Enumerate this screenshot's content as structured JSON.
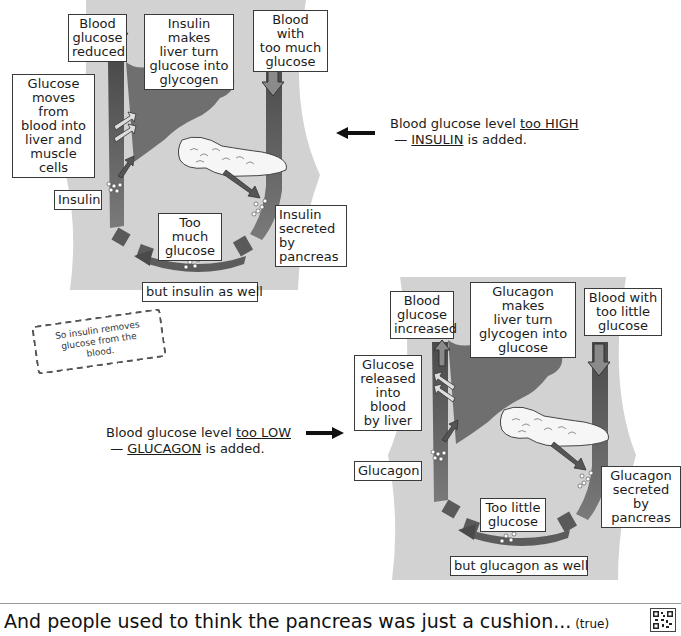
{
  "top_diagram": {
    "boxes": {
      "blood_glucose_reduced": "Blood\nglucose\nreduced",
      "insulin_makes_liver": "Insulin makes\nliver turn\nglucose into\nglycogen",
      "blood_too_much": "Blood with\ntoo much\nglucose",
      "glucose_moves": "Glucose\nmoves from\nblood into\nliver and\nmuscle cells",
      "insulin": "Insulin",
      "insulin_secreted": "Insulin\nsecreted by\npancreas",
      "too_much_glucose": "Too much\nglucose",
      "but_insulin": "but insulin as well"
    },
    "caption": {
      "line1_prefix": "Blood glucose level ",
      "line1_emph": "too HIGH",
      "line2_prefix": "— ",
      "line2_emph": "INSULIN",
      "line2_suffix": " is added."
    }
  },
  "stamp_note": "So insulin removes\nglucose from the blood.",
  "bottom_diagram": {
    "boxes": {
      "blood_glucose_increased": "Blood\nglucose\nincreased",
      "glucagon_makes_liver": "Glucagon makes\nliver turn\nglycogen into\nglucose",
      "blood_too_little": "Blood with\ntoo little\nglucose",
      "glucose_released": "Glucose\nreleased\ninto blood\nby liver",
      "glucagon": "Glucagon",
      "glucagon_secreted": "Glucagon\nsecreted by\npancreas",
      "too_little_glucose": "Too little\nglucose",
      "but_glucagon": "but glucagon as well"
    },
    "caption": {
      "line1_prefix": "Blood glucose level ",
      "line1_emph": "too LOW",
      "line2_prefix": "— ",
      "line2_emph": "GLUCAGON",
      "line2_suffix": " is added."
    }
  },
  "footer": {
    "text": "And people used to think the pancreas was just a cushion...",
    "aside": " (true)",
    "qr_icon": "qr-code-icon"
  },
  "colors": {
    "body_bg": "#cfcfcf",
    "liver": "#6e6e6e",
    "vessel": "#555555",
    "vessel_light": "#8a8a8a",
    "pancreas": "#f4f4f4"
  }
}
